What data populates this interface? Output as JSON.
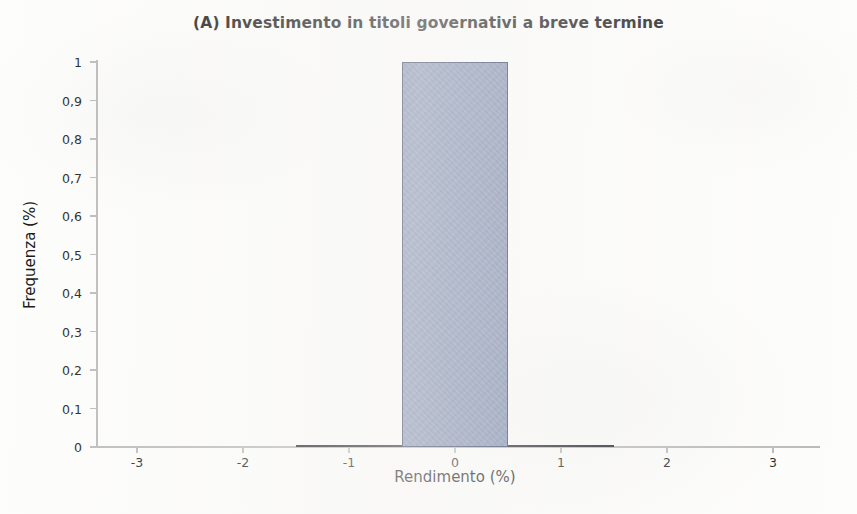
{
  "chart_data": {
    "type": "bar",
    "title": "(A) Investimento in titoli governativi a breve termine",
    "xlabel": "Rendimento (%)",
    "ylabel": "Frequenza (%)",
    "xlim": [
      -3.6,
      3.45
    ],
    "ylim": [
      0,
      1
    ],
    "grid": false,
    "legend": null,
    "bin_width": 1,
    "categories": [
      -1,
      0,
      1
    ],
    "values": [
      0,
      1,
      0
    ],
    "bars": [
      {
        "label": "-1",
        "center": -1,
        "left": -1.5,
        "right": -0.5,
        "value": 0
      },
      {
        "label": "0",
        "center": 0,
        "left": -0.5,
        "right": 0.5,
        "value": 1
      },
      {
        "label": "1",
        "center": 1,
        "left": 0.5,
        "right": 1.5,
        "value": 0
      }
    ],
    "x_ticks": [
      {
        "value": -3,
        "label": "-3"
      },
      {
        "value": -2,
        "label": "-2"
      },
      {
        "value": -1,
        "label": "-1"
      },
      {
        "value": 0,
        "label": "0"
      },
      {
        "value": 1,
        "label": "1"
      },
      {
        "value": 2,
        "label": "2"
      },
      {
        "value": 3,
        "label": "3"
      }
    ],
    "y_ticks": [
      {
        "value": 0,
        "label": "0"
      },
      {
        "value": 0.1,
        "label": "0,1"
      },
      {
        "value": 0.2,
        "label": "0,2"
      },
      {
        "value": 0.3,
        "label": "0,3"
      },
      {
        "value": 0.4,
        "label": "0,4"
      },
      {
        "value": 0.5,
        "label": "0,5"
      },
      {
        "value": 0.6,
        "label": "0,6"
      },
      {
        "value": 0.7,
        "label": "0,7"
      },
      {
        "value": 0.8,
        "label": "0,8"
      },
      {
        "value": 0.9,
        "label": "0,9"
      },
      {
        "value": 1,
        "label": "1"
      }
    ],
    "colors": {
      "bar_fill": "#7c8cae",
      "bar_border": "#2d3a5c",
      "axis": "#b9b9b9",
      "text": "#111111",
      "background": "#fdfdfc"
    }
  }
}
